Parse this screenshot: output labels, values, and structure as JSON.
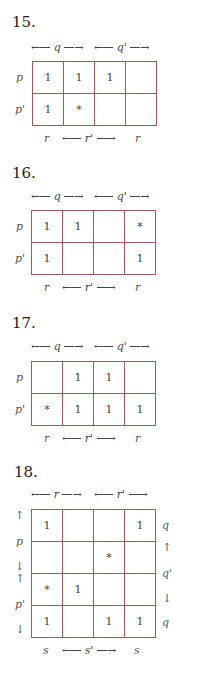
{
  "problems": [
    {
      "number": "15.",
      "top_labels": [
        "q",
        "q'"
      ],
      "row_labels": [
        "p",
        "p'"
      ],
      "bottom_labels": [
        "r",
        "r'",
        "r"
      ],
      "cells": [
        [
          "1",
          "1",
          "1",
          ""
        ],
        [
          "1",
          "*",
          "",
          ""
        ]
      ]
    },
    {
      "number": "16.",
      "top_labels": [
        "q",
        "q'"
      ],
      "row_labels": [
        "p",
        "p'"
      ],
      "bottom_labels": [
        "r",
        "r'",
        "r"
      ],
      "cells": [
        [
          "1",
          "1",
          "",
          "*"
        ],
        [
          "1",
          "",
          "",
          "1"
        ]
      ]
    },
    {
      "number": "17.",
      "top_labels": [
        "q",
        "q'"
      ],
      "row_labels": [
        "p",
        "p'"
      ],
      "bottom_labels": [
        "r",
        "r'",
        "r"
      ],
      "cells": [
        [
          "",
          "1",
          "1",
          ""
        ],
        [
          "*",
          "1",
          "1",
          "1"
        ]
      ]
    },
    {
      "number": "18.",
      "top_labels": [
        "r",
        "r'"
      ],
      "left_labels": [
        "p",
        "p'"
      ],
      "right_labels": [
        "q",
        "q'",
        "q"
      ],
      "bottom_labels": [
        "s",
        "s'",
        "s"
      ],
      "cells": [
        [
          "1",
          "",
          "",
          "1"
        ],
        [
          "",
          "",
          "*",
          ""
        ],
        [
          "*",
          "1",
          "",
          ""
        ],
        [
          "1",
          "",
          "1",
          "1"
        ]
      ]
    }
  ],
  "colors": {
    "grid_line": "#a05a5a",
    "text": "#333333"
  }
}
